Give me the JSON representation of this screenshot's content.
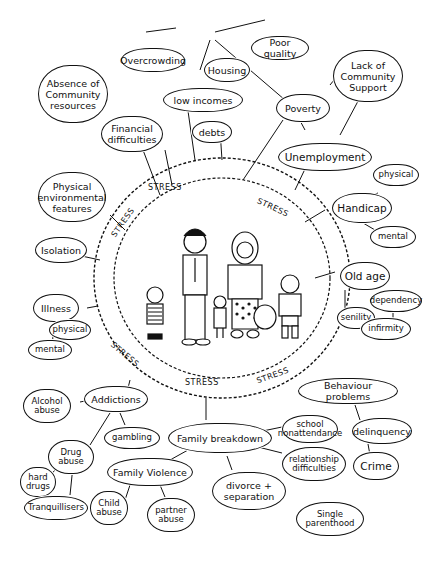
{
  "diagram": {
    "center": {
      "label": "family",
      "stress_labels": [
        "STRESS",
        "STRESS",
        "STRESS",
        "STRESS",
        "STRESS",
        "STRESS",
        "STRESS"
      ]
    },
    "nodes": {
      "overcrowding": "Overcrowding",
      "housing": "Housing",
      "poor_quality": "Poor quality",
      "absence_community": "Absence of Community resources",
      "lack_support": "Lack of Community Support",
      "low_incomes": "low incomes",
      "poverty": "Poverty",
      "financial": "Financial difficulties",
      "debts": "debts",
      "unemployment": "Unemployment",
      "physical_env": "Physical environmental features",
      "physical_h": "physical",
      "handicap": "Handicap",
      "mental_h": "mental",
      "isolation": "Isolation",
      "old_age": "Old age",
      "dependency": "dependency",
      "senility": "senility",
      "infirmity": "infirmity",
      "illness": "Illness",
      "physical_i": "physical",
      "mental_i": "mental",
      "behaviour": "Behaviour problems",
      "alcohol": "Alcohol abuse",
      "addictions": "Addictions",
      "school": "school nonattendance",
      "delinquency": "delinquency",
      "drug": "Drug abuse",
      "gambling": "gambling",
      "family_breakdown": "Family breakdown",
      "relationship": "relationship difficulties",
      "crime": "Crime",
      "hard_drugs": "hard drugs",
      "family_violence": "Family Violence",
      "divorce": "divorce + separation",
      "tranquillisers": "Tranquillisers",
      "child_abuse": "Child abuse",
      "partner_abuse": "partner abuse",
      "single": "Single parenthood"
    }
  }
}
